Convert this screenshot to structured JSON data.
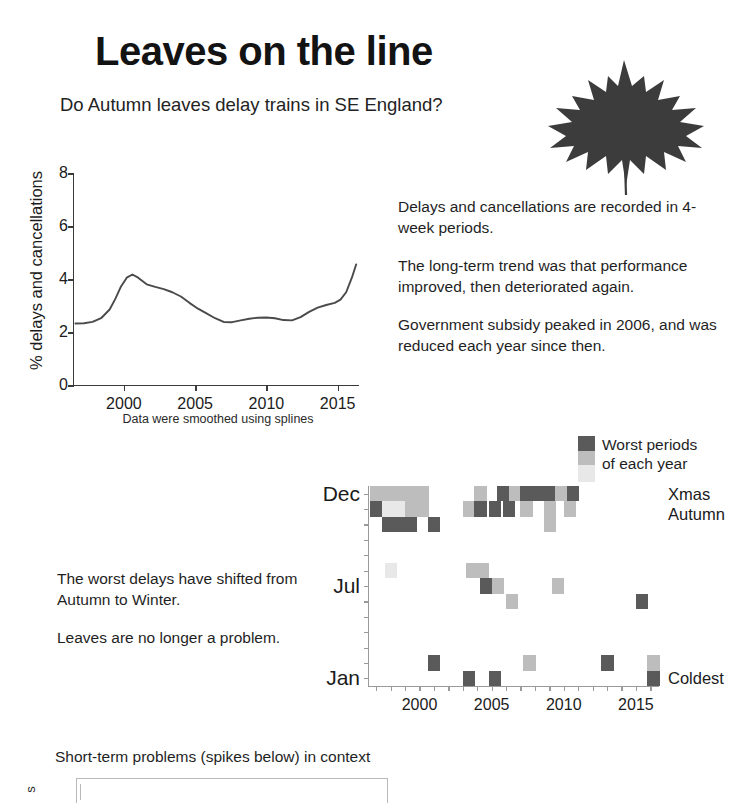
{
  "header": {
    "title": "Leaves on the line",
    "subtitle": "Do Autumn leaves delay trains in SE England?",
    "leaf_icon": "maple-leaf-icon",
    "leaf_color": "#3c3c3c"
  },
  "notes": {
    "p1": "Delays and cancellations are recorded in 4-week periods.",
    "p2": "The long-term trend was that performance improved, then deteriorated again.",
    "p3": "Government subsidy peaked in 2006, and was reduced each year since then."
  },
  "shift_notes": {
    "p1": "The worst delays have shifted from Autumn to Winter.",
    "p2": "Leaves are no longer a problem."
  },
  "legend": {
    "line1": "Worst periods",
    "line2": "of each year",
    "colors": [
      "#5a5a5a",
      "#bdbdbd",
      "#e8e8e8"
    ]
  },
  "bottom": {
    "title": "Short-term problems (spikes below) in context",
    "ylabel": "s"
  },
  "chart_data": [
    {
      "type": "line",
      "title": "",
      "xlabel": "",
      "ylabel": "% delays and cancellations",
      "caption": "Data were smoothed using splines",
      "xlim": [
        1996.5,
        2016.5
      ],
      "ylim": [
        0,
        8
      ],
      "yticks": [
        0,
        2,
        4,
        6,
        8
      ],
      "xticks": [
        2000,
        2005,
        2010,
        2015
      ],
      "grid": false,
      "legend": "none",
      "series": [
        {
          "name": "% delays and cancellations (smoothed)",
          "x": [
            1996.6,
            1997.2,
            1997.8,
            1998.4,
            1999.0,
            1999.4,
            1999.8,
            2000.2,
            2000.6,
            2001.0,
            2001.6,
            2002.2,
            2002.8,
            2003.4,
            2004.0,
            2004.6,
            2005.2,
            2005.8,
            2006.4,
            2007.0,
            2007.6,
            2008.2,
            2008.8,
            2009.4,
            2010.0,
            2010.6,
            2011.2,
            2011.8,
            2012.4,
            2013.0,
            2013.6,
            2014.2,
            2014.8,
            2015.2,
            2015.6,
            2016.0,
            2016.3
          ],
          "y": [
            2.32,
            2.33,
            2.38,
            2.52,
            2.85,
            3.25,
            3.72,
            4.05,
            4.17,
            4.05,
            3.8,
            3.7,
            3.62,
            3.5,
            3.34,
            3.1,
            2.88,
            2.7,
            2.52,
            2.38,
            2.37,
            2.44,
            2.5,
            2.54,
            2.55,
            2.52,
            2.45,
            2.44,
            2.56,
            2.76,
            2.92,
            3.02,
            3.1,
            3.22,
            3.5,
            4.05,
            4.55
          ]
        }
      ]
    },
    {
      "type": "heatmap",
      "title": "",
      "xlabel": "",
      "ylabel": "",
      "xlim": [
        1996.5,
        2016.6
      ],
      "ylim": [
        0,
        13
      ],
      "xticks": [
        2000,
        2005,
        2010,
        2015
      ],
      "yticks_labels": [
        "Jan",
        "Jul",
        "Dec"
      ],
      "yticks_values": [
        0.5,
        6.5,
        12.5
      ],
      "right_labels": [
        {
          "text": "Xmas",
          "value": 12.5
        },
        {
          "text": "Autumn",
          "value": 11.2
        },
        {
          "text": "Coldest",
          "value": 0.5
        }
      ],
      "scale_colors": [
        "#5a5a5a",
        "#bdbdbd",
        "#e8e8e8"
      ],
      "note": "Each cell marks a 4-week period flagged as a worst period of that year; darker = worse.",
      "cells": [
        {
          "x": 1996.6,
          "y": 12,
          "shade": 1
        },
        {
          "x": 1997.4,
          "y": 12,
          "shade": 1
        },
        {
          "x": 1998.2,
          "y": 12,
          "shade": 1
        },
        {
          "x": 1999.0,
          "y": 12,
          "shade": 1
        },
        {
          "x": 1999.8,
          "y": 12,
          "shade": 1
        },
        {
          "x": 1996.6,
          "y": 11,
          "shade": 0
        },
        {
          "x": 1997.4,
          "y": 11,
          "shade": 2
        },
        {
          "x": 1998.2,
          "y": 11,
          "shade": 2
        },
        {
          "x": 1999.0,
          "y": 11,
          "shade": 1
        },
        {
          "x": 1999.8,
          "y": 11,
          "shade": 1
        },
        {
          "x": 1997.4,
          "y": 10,
          "shade": 0
        },
        {
          "x": 1998.2,
          "y": 10,
          "shade": 0
        },
        {
          "x": 1999.0,
          "y": 10,
          "shade": 0
        },
        {
          "x": 2000.6,
          "y": 10,
          "shade": 0
        },
        {
          "x": 2003.8,
          "y": 12,
          "shade": 1
        },
        {
          "x": 2003.0,
          "y": 11,
          "shade": 1
        },
        {
          "x": 2003.8,
          "y": 11,
          "shade": 0
        },
        {
          "x": 2005.4,
          "y": 12,
          "shade": 0
        },
        {
          "x": 2006.2,
          "y": 12,
          "shade": 1
        },
        {
          "x": 2004.8,
          "y": 11,
          "shade": 0
        },
        {
          "x": 2005.8,
          "y": 11,
          "shade": 0
        },
        {
          "x": 2007.0,
          "y": 12,
          "shade": 0
        },
        {
          "x": 2007.8,
          "y": 12,
          "shade": 0
        },
        {
          "x": 2008.6,
          "y": 12,
          "shade": 0
        },
        {
          "x": 2007.0,
          "y": 11,
          "shade": 1
        },
        {
          "x": 2008.6,
          "y": 11,
          "shade": 1
        },
        {
          "x": 2008.6,
          "y": 10,
          "shade": 1
        },
        {
          "x": 2009.4,
          "y": 12,
          "shade": 1
        },
        {
          "x": 2010.2,
          "y": 12,
          "shade": 0
        },
        {
          "x": 2010.0,
          "y": 11,
          "shade": 1
        },
        {
          "x": 1997.6,
          "y": 7,
          "shade": 2
        },
        {
          "x": 2003.2,
          "y": 7,
          "shade": 1
        },
        {
          "x": 2004.0,
          "y": 7,
          "shade": 1
        },
        {
          "x": 2004.2,
          "y": 6,
          "shade": 0
        },
        {
          "x": 2005.0,
          "y": 6,
          "shade": 1
        },
        {
          "x": 2006.0,
          "y": 5,
          "shade": 1
        },
        {
          "x": 2009.2,
          "y": 6,
          "shade": 1
        },
        {
          "x": 2015.0,
          "y": 5,
          "shade": 0
        },
        {
          "x": 2000.6,
          "y": 1,
          "shade": 0
        },
        {
          "x": 2003.0,
          "y": 0,
          "shade": 0
        },
        {
          "x": 2004.8,
          "y": 0,
          "shade": 0
        },
        {
          "x": 2007.2,
          "y": 1,
          "shade": 1
        },
        {
          "x": 2012.6,
          "y": 1,
          "shade": 0
        },
        {
          "x": 2015.8,
          "y": 1,
          "shade": 1
        },
        {
          "x": 2015.8,
          "y": 0,
          "shade": 0
        }
      ]
    }
  ]
}
